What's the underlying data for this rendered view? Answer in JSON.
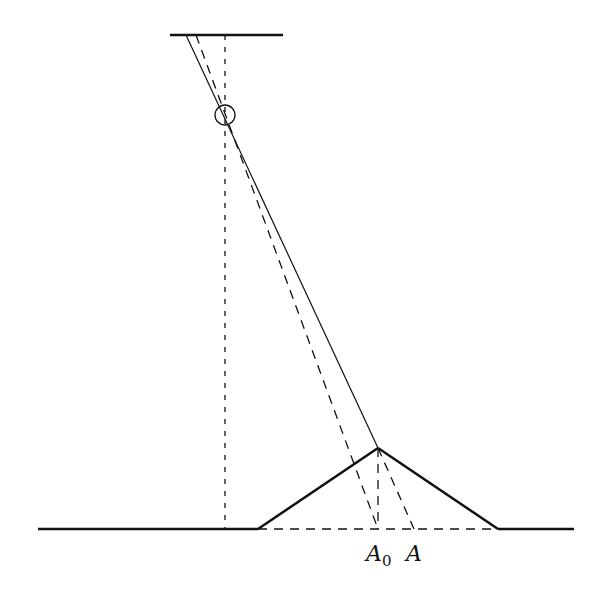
{
  "diagram": {
    "type": "geometric optics / surveying sketch",
    "colors": {
      "stroke": "#111111",
      "background": "#ffffff"
    },
    "top_line": {
      "x1": 170,
      "y1": 35,
      "x2": 283,
      "y2": 35
    },
    "ground_left": {
      "x1": 38,
      "y1": 529,
      "x2": 258,
      "y2": 529
    },
    "ground_right": {
      "x1": 498,
      "y1": 529,
      "x2": 574,
      "y2": 529
    },
    "ground_dashed": {
      "x1": 258,
      "y1": 529,
      "x2": 498,
      "y2": 529
    },
    "peak": {
      "x": 378,
      "y": 448
    },
    "hill_left": {
      "x1": 258,
      "y1": 529,
      "x2": 378,
      "y2": 448
    },
    "hill_right": {
      "x1": 378,
      "y1": 448,
      "x2": 498,
      "y2": 529
    },
    "sight_solid": {
      "x1": 186,
      "y1": 35,
      "x2": 378,
      "y2": 448
    },
    "sight_dashed": {
      "x1": 196,
      "y1": 35,
      "x2": 378,
      "y2": 529
    },
    "vertical_dashed": {
      "x1": 225,
      "y1": 35,
      "x2": 225,
      "y2": 529
    },
    "peak_to_A0": {
      "x1": 378,
      "y1": 448,
      "x2": 378,
      "y2": 529
    },
    "peak_to_A": {
      "x1": 378,
      "y1": 448,
      "x2": 414,
      "y2": 529
    },
    "lens_circle": {
      "cx": 225,
      "cy": 115,
      "r": 10
    },
    "labels": {
      "A0_main": "A",
      "A0_sub": "0",
      "A": "A"
    }
  }
}
